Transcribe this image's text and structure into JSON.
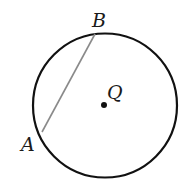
{
  "diagram": {
    "type": "circle-with-chord",
    "circle": {
      "center_label": "Q",
      "cx": 105,
      "cy": 105.5,
      "r": 72,
      "stroke": "#111111"
    },
    "chord": {
      "from": "A",
      "to": "B",
      "stroke": "#8a8a8a"
    },
    "points": [
      {
        "label": "A",
        "x": 42,
        "y": 132
      },
      {
        "label": "B",
        "x": 95,
        "y": 34
      },
      {
        "label": "Q",
        "x": 104,
        "y": 105
      }
    ],
    "labels": {
      "a": "A",
      "b": "B",
      "q": "Q"
    }
  }
}
